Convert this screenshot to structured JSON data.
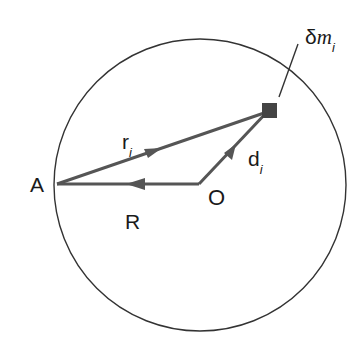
{
  "diagram": {
    "labels": {
      "point_A": "A",
      "origin_O": "O",
      "vector_R": "R",
      "vector_r": "r",
      "vector_r_sub": "i",
      "vector_d": "d",
      "vector_d_sub": "i",
      "mass_delta": "δ",
      "mass_m": "m",
      "mass_sub": "i"
    },
    "colors": {
      "circle": "#333333",
      "vectors": "#555555",
      "mass": "#444444",
      "text": "#1a1a1a"
    }
  }
}
